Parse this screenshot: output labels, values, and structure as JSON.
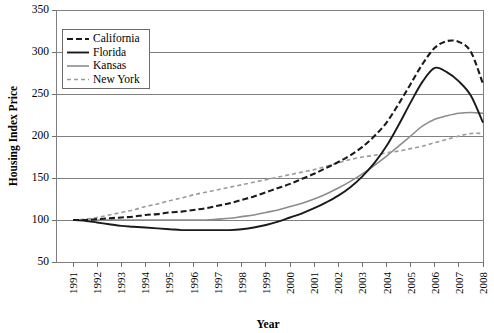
{
  "chart_data": {
    "type": "line",
    "title": "",
    "xlabel": "Year",
    "ylabel": "Housing Index Price",
    "xlim": [
      1991,
      2008
    ],
    "ylim": [
      50,
      350
    ],
    "ytick_step": 50,
    "yticks": [
      50,
      100,
      150,
      200,
      250,
      300,
      350
    ],
    "xticks": [
      1991,
      1992,
      1993,
      1994,
      1995,
      1996,
      1997,
      1998,
      1999,
      2000,
      2001,
      2002,
      2003,
      2004,
      2005,
      2006,
      2007,
      2008
    ],
    "x": [
      1991,
      1991.5,
      1992,
      1992.5,
      1993,
      1993.5,
      1994,
      1994.5,
      1995,
      1995.5,
      1996,
      1996.5,
      1997,
      1997.5,
      1998,
      1998.5,
      1999,
      1999.5,
      2000,
      2000.5,
      2001,
      2001.5,
      2002,
      2002.5,
      2003,
      2003.5,
      2004,
      2004.5,
      2005,
      2005.5,
      2006,
      2006.5,
      2007,
      2007.5,
      2008,
      2008.5
    ],
    "grid": true,
    "grid_axis": "y",
    "legend_position": "upper-left-inside",
    "series": [
      {
        "name": "California",
        "style": "dashed",
        "color": "#1a1a1a",
        "width": 2.1,
        "dash": "6,3",
        "values": [
          100,
          100,
          101,
          102,
          103,
          104,
          106,
          107,
          109,
          110,
          112,
          114,
          117,
          120,
          124,
          128,
          133,
          138,
          143,
          149,
          155,
          162,
          169,
          177,
          187,
          200,
          216,
          238,
          262,
          286,
          305,
          313,
          312,
          300,
          262,
          218
        ]
      },
      {
        "name": "Florida",
        "style": "solid",
        "color": "#1a1a1a",
        "width": 1.9,
        "dash": "",
        "values": [
          100,
          99,
          97,
          95,
          93,
          92,
          91,
          90,
          89,
          88,
          88,
          88,
          88,
          88,
          89,
          91,
          94,
          98,
          103,
          108,
          114,
          121,
          129,
          139,
          152,
          168,
          188,
          213,
          240,
          265,
          281,
          276,
          265,
          248,
          216,
          178
        ]
      },
      {
        "name": "Kansas",
        "style": "solid",
        "color": "#8c8c8c",
        "width": 1.6,
        "dash": "",
        "values": [
          100,
          100,
          100,
          100,
          100,
          100,
          100,
          100,
          100,
          100,
          100,
          100,
          101,
          102,
          104,
          106,
          109,
          112,
          116,
          120,
          125,
          131,
          138,
          146,
          155,
          165,
          176,
          188,
          200,
          212,
          220,
          224,
          227,
          228,
          227,
          220
        ]
      },
      {
        "name": "New York",
        "style": "dashed",
        "color": "#9a9a9a",
        "width": 1.6,
        "dash": "4,3",
        "values": [
          100,
          101,
          103,
          106,
          109,
          112,
          116,
          119,
          123,
          126,
          130,
          133,
          136,
          139,
          142,
          145,
          148,
          151,
          154,
          157,
          160,
          164,
          168,
          172,
          175,
          177,
          180,
          182,
          185,
          188,
          192,
          196,
          200,
          203,
          203,
          200
        ]
      }
    ]
  },
  "legend": {
    "entries": [
      {
        "label": "California"
      },
      {
        "label": "Florida"
      },
      {
        "label": "Kansas"
      },
      {
        "label": "New York"
      }
    ]
  },
  "axes": {
    "y_title": "Housing Index Price",
    "x_title": "Year",
    "y_labels": [
      "350",
      "300",
      "250",
      "200",
      "150",
      "100",
      "50"
    ],
    "x_labels": [
      "1991",
      "1992",
      "1993",
      "1994",
      "1995",
      "1996",
      "1997",
      "1998",
      "1999",
      "2000",
      "2001",
      "2002",
      "2003",
      "2004",
      "2005",
      "2006",
      "2007",
      "2008"
    ]
  },
  "colors": {
    "grid": "#808080",
    "axis": "#7f7f7f",
    "california": "#1a1a1a",
    "florida": "#1a1a1a",
    "kansas": "#8c8c8c",
    "newyork": "#9a9a9a",
    "background": "#ffffff"
  }
}
